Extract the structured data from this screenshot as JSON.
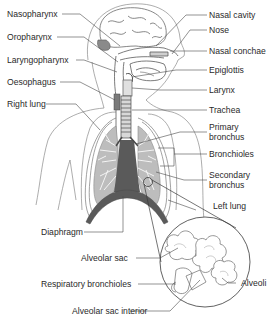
{
  "diagram": {
    "colors": {
      "line": "#4a4a4a",
      "organ_fill": "#5a5a5a",
      "lung_tissue": "#9a9a9a",
      "outline": "#8a8a8a",
      "text": "#2a2a2a",
      "background": "#ffffff"
    },
    "labels_left": [
      {
        "id": "nasopharynx",
        "text": "Nasopharynx"
      },
      {
        "id": "oropharynx",
        "text": "Oropharynx"
      },
      {
        "id": "laryngopharynx",
        "text": "Laryngopharynx"
      },
      {
        "id": "oesophagus",
        "text": "Oesophagus"
      },
      {
        "id": "right-lung",
        "text": "Right lung"
      },
      {
        "id": "diaphragm",
        "text": "Diaphragm"
      }
    ],
    "labels_right": [
      {
        "id": "nasal-cavity",
        "text": "Nasal cavity"
      },
      {
        "id": "nose",
        "text": "Nose"
      },
      {
        "id": "nasal-conchae",
        "text": "Nasal conchae"
      },
      {
        "id": "epiglottis",
        "text": "Epiglottis"
      },
      {
        "id": "larynx",
        "text": "Larynx"
      },
      {
        "id": "trachea",
        "text": "Trachea"
      },
      {
        "id": "primary-bronchus",
        "line1": "Primary",
        "line2": "bronchus"
      },
      {
        "id": "bronchioles",
        "text": "Bronchioles"
      },
      {
        "id": "secondary-bronchus",
        "line1": "Secondary",
        "line2": "bronchus"
      },
      {
        "id": "left-lung",
        "text": "Left lung"
      }
    ],
    "labels_inset": [
      {
        "id": "alveolar-sac",
        "text": "Alveolar sac"
      },
      {
        "id": "respiratory-bronchioles",
        "text": "Respiratory bronchioles"
      },
      {
        "id": "alveoli",
        "text": "Alveoli"
      },
      {
        "id": "alveolar-sac-interior",
        "text": "Alveolar sac interior"
      }
    ]
  }
}
